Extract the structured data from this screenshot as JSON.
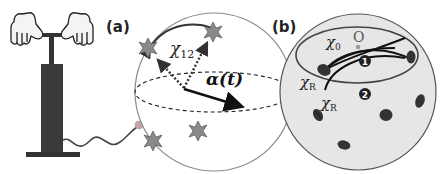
{
  "figure": {
    "panel_a": {
      "label": "(a)",
      "chi_label": "χ",
      "chi_sub": "12",
      "alpha_label": "α(t)",
      "colors": {
        "sphere_fill": "#ffffff",
        "sphere_stroke": "#888888",
        "star": "#8a8a8a",
        "arrow": "#111111"
      }
    },
    "panel_b": {
      "label": "(b)",
      "chi0_label": "χ",
      "chi0_sub": "0",
      "origin_label": "O",
      "chiR_label_1": "χ",
      "chiR_sub_1": "R",
      "chiR_label_2": "χ",
      "chiR_sub_2": "R",
      "path_1": "1",
      "path_2": "2",
      "colors": {
        "sphere_fill": "#e8e8e8",
        "sphere_stroke": "#555555",
        "blob": "#333333"
      }
    },
    "pump": {
      "colors": {
        "body": "#333333",
        "wire": "#444444",
        "tip": "#c8a0a0"
      }
    }
  }
}
